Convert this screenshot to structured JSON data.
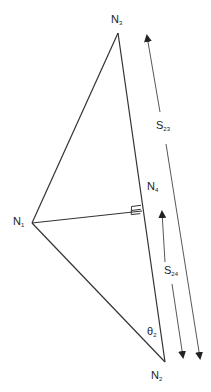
{
  "diagram": {
    "type": "geometry-triangle",
    "stroke_color": "#333333",
    "label_color": "#222222",
    "nodes": [
      {
        "id": "N1",
        "base": "N",
        "sub": "1",
        "x": 32,
        "y": 223
      },
      {
        "id": "N2",
        "base": "N",
        "sub": "2",
        "x": 165,
        "y": 362
      },
      {
        "id": "N3",
        "base": "N",
        "sub": "3",
        "x": 118,
        "y": 33
      },
      {
        "id": "N4",
        "base": "N",
        "sub": "4",
        "x": 142,
        "y": 210
      }
    ],
    "edges": [
      {
        "from": "N1",
        "to": "N3"
      },
      {
        "from": "N3",
        "to": "N2"
      },
      {
        "from": "N1",
        "to": "N2"
      },
      {
        "from": "N1",
        "to": "N4",
        "note": "perpendicular foot with right-angle marker"
      }
    ],
    "labels": {
      "n1": {
        "base": "N",
        "sub": "1"
      },
      "n2": {
        "base": "N",
        "sub": "2"
      },
      "n3": {
        "base": "N",
        "sub": "3"
      },
      "n4": {
        "base": "N",
        "sub": "4"
      },
      "s23": {
        "base": "S",
        "sub": "23"
      },
      "s24": {
        "base": "S",
        "sub": "24"
      },
      "theta2": {
        "base": "θ",
        "sub": "2"
      }
    },
    "dimension_arrows": [
      {
        "name": "S23",
        "from": [
          147,
          34
        ],
        "to": [
          200,
          361
        ],
        "label": "S23",
        "double_headed": true
      },
      {
        "name": "S24",
        "from": [
          162,
          210
        ],
        "to": [
          183,
          360
        ],
        "label": "S24",
        "double_headed": true
      }
    ],
    "right_angle_marker": {
      "at": "N4"
    },
    "angle_marker": {
      "label": "θ2",
      "at": "N2"
    }
  }
}
